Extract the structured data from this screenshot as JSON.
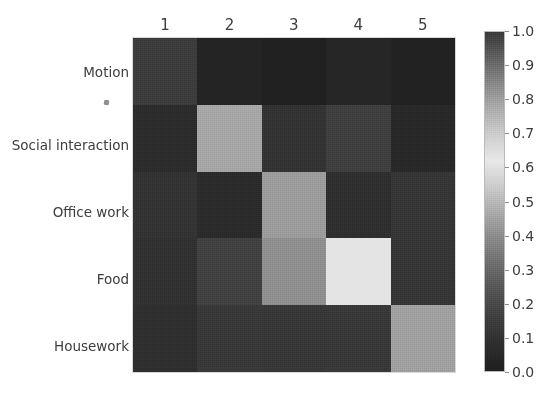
{
  "figure": {
    "type": "heatmap",
    "background": "#ffffff"
  },
  "axes": {
    "x_tick_labels": [
      "1",
      "2",
      "3",
      "4",
      "5"
    ],
    "y_tick_labels": [
      "Motion",
      "Social interaction",
      "Office work",
      "Food",
      "Housework"
    ],
    "stray_mark": "·"
  },
  "colorbar": {
    "tick_labels": [
      "1.0",
      "0.9",
      "0.8",
      "0.7",
      "0.6",
      "0.5",
      "0.4",
      "0.3",
      "0.2",
      "0.1",
      "0.0"
    ],
    "vmin": 0.0,
    "vmax": 1.0,
    "orientation": "vertical",
    "position": "right"
  },
  "chart_data": {
    "type": "heatmap",
    "title": "",
    "xlabel": "",
    "ylabel": "",
    "categories_x": [
      "1",
      "2",
      "3",
      "4",
      "5"
    ],
    "categories_y": [
      "Motion",
      "Social interaction",
      "Office work",
      "Food",
      "Housework"
    ],
    "values": [
      [
        0.2,
        0.05,
        0.04,
        0.06,
        0.05
      ],
      [
        0.09,
        0.55,
        0.11,
        0.17,
        0.07
      ],
      [
        0.12,
        0.09,
        0.5,
        0.1,
        0.13
      ],
      [
        0.11,
        0.18,
        0.45,
        0.66,
        0.13
      ],
      [
        0.1,
        0.14,
        0.13,
        0.14,
        0.5
      ]
    ],
    "cell_colors": [
      [
        "#3c3c3c",
        "#242424",
        "#202020",
        "#262626",
        "#222222"
      ],
      [
        "#2c2c2c",
        "#a6a6a6",
        "#333333",
        "#3f3f3f",
        "#282828"
      ],
      [
        "#333333",
        "#2b2b2b",
        "#9c9c9c",
        "#2f2f2f",
        "#353535"
      ],
      [
        "#313131",
        "#414141",
        "#8f8f8f",
        "#e4e4e4",
        "#353535"
      ],
      [
        "#2e2e2e",
        "#383838",
        "#373737",
        "#383838",
        "#a0a0a0"
      ]
    ],
    "colormap": "gray-nonmonotonic",
    "vmin": 0.0,
    "vmax": 1.0,
    "grid": false,
    "legend": "colorbar-right"
  }
}
